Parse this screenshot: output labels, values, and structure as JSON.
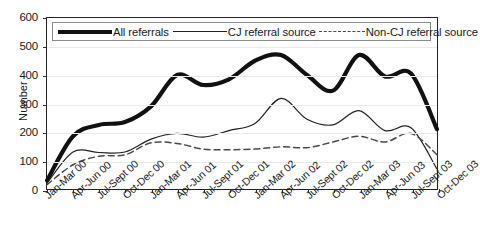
{
  "chart_data": {
    "type": "line",
    "title": "",
    "xlabel": "",
    "ylabel": "Number",
    "ylim": [
      0,
      600
    ],
    "ytick_step": 100,
    "yticks": [
      0,
      100,
      200,
      300,
      400,
      500,
      600
    ],
    "grid": true,
    "legend_position": "top-inside",
    "categories": [
      "Jan-Mar 00",
      "Apr-Jun 00",
      "Jul-Sept 00",
      "Oct-Dec 00",
      "Jan-Mar 01",
      "Apr-Jun 01",
      "Jul-Sept 01",
      "Oct-Dec 01",
      "Jan-Mar 02",
      "Apr-Jun 02",
      "Jul-Sept 02",
      "Oct-Dec 02",
      "Jan-Mar 03",
      "Apr-Jun 03",
      "Jul-Sept 03",
      "Oct-Dec 03"
    ],
    "series": [
      {
        "name": "All referrals",
        "style": "thick-solid",
        "color": "#111111",
        "values": [
          30,
          185,
          225,
          235,
          290,
          400,
          365,
          385,
          450,
          470,
          400,
          345,
          470,
          395,
          405,
          210
        ]
      },
      {
        "name": "CJ referral source",
        "style": "thin-solid",
        "color": "#222222",
        "values": [
          20,
          130,
          128,
          130,
          175,
          195,
          182,
          205,
          230,
          318,
          245,
          225,
          275,
          205,
          215,
          70
        ]
      },
      {
        "name": "Non-CJ referral source",
        "style": "dashed",
        "color": "#4a4a4a",
        "values": [
          15,
          85,
          115,
          120,
          162,
          160,
          140,
          138,
          140,
          148,
          145,
          165,
          185,
          165,
          195,
          120
        ]
      }
    ]
  },
  "axis": {
    "y_title": "Number",
    "y_labels": [
      "600",
      "500",
      "400",
      "300",
      "200",
      "100",
      "0"
    ]
  },
  "legend": {
    "items": [
      {
        "label": "All referrals"
      },
      {
        "label": "CJ referral source"
      },
      {
        "label": "Non-CJ referral source"
      }
    ]
  }
}
